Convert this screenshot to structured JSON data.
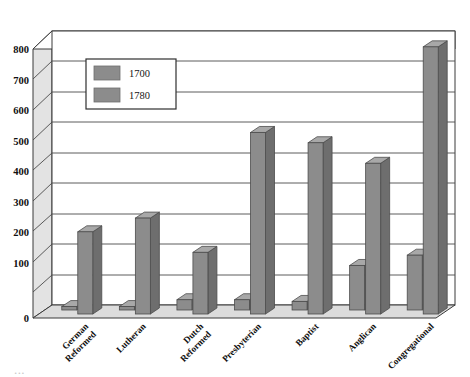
{
  "chart_data": {
    "type": "bar",
    "title": "",
    "subtitle": "",
    "xlabel": "",
    "ylabel": "",
    "ylim": [
      0,
      800
    ],
    "ytick_step": 100,
    "ytick_labels": [
      "0",
      "100",
      "200",
      "300",
      "400",
      "500",
      "600",
      "700",
      "800"
    ],
    "grid": true,
    "legend_position": "inside-top-left",
    "style": "3d-bar-chart",
    "categories": [
      "German Reformed",
      "Lutheran",
      "Dutch Reformed",
      "Presbyterian",
      "Baptist",
      "Anglican",
      "Congregational"
    ],
    "series": [
      {
        "name": "1700",
        "color": "#8c8c8c",
        "values": [
          10,
          10,
          30,
          30,
          25,
          130,
          160
        ]
      },
      {
        "name": "1780",
        "color": "#8c8c8c",
        "values": [
          240,
          280,
          180,
          530,
          500,
          440,
          780
        ]
      }
    ]
  },
  "legend": {
    "entries": [
      {
        "label": "1700"
      },
      {
        "label": "1780"
      }
    ]
  },
  "axis": {
    "y": {
      "ticks": [
        "800",
        "700",
        "600",
        "500",
        "400",
        "300",
        "200",
        "100",
        "0"
      ]
    },
    "x": {
      "labels": [
        {
          "line1": "German",
          "line2": "Reformed"
        },
        {
          "line1": "Lutheran",
          "line2": ""
        },
        {
          "line1": "Dutch",
          "line2": "Reformed"
        },
        {
          "line1": "Presbyterian",
          "line2": ""
        },
        {
          "line1": "Baptist",
          "line2": ""
        },
        {
          "line1": "Anglican",
          "line2": ""
        },
        {
          "line1": "Congregational",
          "line2": ""
        }
      ]
    }
  },
  "colors": {
    "bar_front": "#8c8c8c",
    "bar_side": "#6e6e6e",
    "bar_top": "#a8a8a8",
    "wall_back": "#ffffff",
    "wall_left": "#e3e3e3",
    "floor": "#dcdcdc",
    "grid": "#4a4a4a",
    "outline": "#3a3a3a",
    "legend_bg": "#ffffff"
  },
  "footer": {
    "clipped_text": "...",
    "visible": true
  }
}
